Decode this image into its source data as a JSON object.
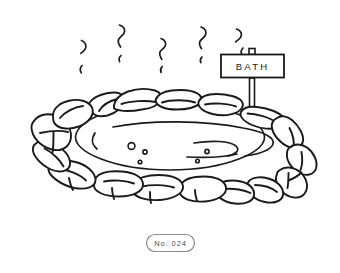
{
  "canvas": {
    "width": 340,
    "height": 273,
    "background_color": "#ffffff",
    "ink_color": "#1a1a1a",
    "caption_ink_color": "#555555"
  },
  "illustration": {
    "subject_name": "hot-spring-bath",
    "style": "black-and-white-line-art"
  },
  "sign": {
    "label": "BATH",
    "name": "bath-sign"
  },
  "caption": {
    "label": "No. 024",
    "name": "illustration-number-label"
  },
  "steam": {
    "count": 5,
    "name": "steam-wisps"
  },
  "water": {
    "bubble_count": 5,
    "swirl_count": 3,
    "name": "water-surface"
  },
  "rocks": {
    "count": 16,
    "name": "stone-ring"
  }
}
